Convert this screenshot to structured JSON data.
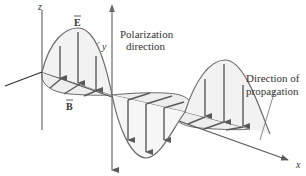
{
  "diagram": {
    "type": "electromagnetic-wave",
    "labels": {
      "z_axis": "z",
      "y_axis": "y",
      "x_axis": "x",
      "e_field": "E",
      "b_field": "B",
      "polarization_line1": "Polarization",
      "polarization_line2": "direction",
      "propagation_line1": "Direction of",
      "propagation_line2": "propagation"
    },
    "colors": {
      "line": "#6b6b6b",
      "fill": "#eeeeee",
      "arrow": "#5a5a5a",
      "text": "#333333"
    }
  }
}
